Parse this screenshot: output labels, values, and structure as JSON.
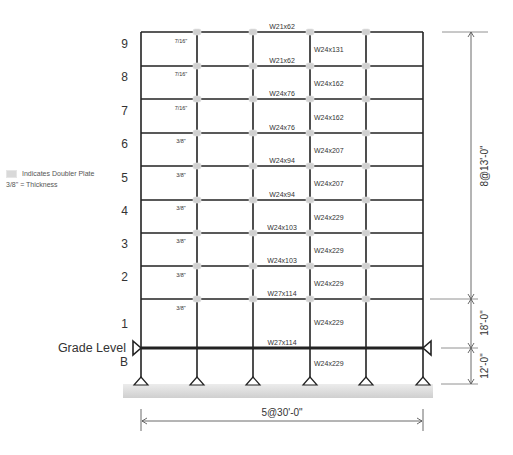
{
  "legend": {
    "doubler_plate_label": "Indicates Doubler Plate",
    "thickness_label": "3/8\" = Thickness"
  },
  "grid": {
    "columns_x": [
      141,
      197,
      253,
      310,
      366,
      423
    ],
    "floor_levels": [
      {
        "label": "9",
        "y": 32
      },
      {
        "label": "8",
        "y": 66
      },
      {
        "label": "7",
        "y": 99
      },
      {
        "label": "6",
        "y": 133
      },
      {
        "label": "5",
        "y": 166
      },
      {
        "label": "4",
        "y": 200
      },
      {
        "label": "3",
        "y": 233
      },
      {
        "label": "2",
        "y": 266
      },
      {
        "label": "1",
        "y": 299
      }
    ],
    "grade_y": 348,
    "base_y": 383
  },
  "story_labels": [
    {
      "label": "9",
      "y": 48
    },
    {
      "label": "8",
      "y": 81
    },
    {
      "label": "7",
      "y": 115
    },
    {
      "label": "6",
      "y": 148
    },
    {
      "label": "5",
      "y": 182
    },
    {
      "label": "4",
      "y": 215
    },
    {
      "label": "3",
      "y": 248
    },
    {
      "label": "2",
      "y": 281
    },
    {
      "label": "1",
      "y": 328
    },
    {
      "label": "B",
      "y": 366
    }
  ],
  "grade_label": "Grade Level",
  "beams": [
    {
      "label": "W21x62",
      "y": 29
    },
    {
      "label": "W21x62",
      "y": 63
    },
    {
      "label": "W24x76",
      "y": 96
    },
    {
      "label": "W24x76",
      "y": 130
    },
    {
      "label": "W24x94",
      "y": 163
    },
    {
      "label": "W24x94",
      "y": 197
    },
    {
      "label": "W24x103",
      "y": 230
    },
    {
      "label": "W24x103",
      "y": 263
    },
    {
      "label": "W27x114",
      "y": 296
    },
    {
      "label": "W27x114",
      "y": 345
    }
  ],
  "columns": [
    {
      "label": "W24x131",
      "y": 52
    },
    {
      "label": "W24x162",
      "y": 86
    },
    {
      "label": "W24x162",
      "y": 120
    },
    {
      "label": "W24x207",
      "y": 153
    },
    {
      "label": "W24x207",
      "y": 186
    },
    {
      "label": "W24x229",
      "y": 220
    },
    {
      "label": "W24x229",
      "y": 253
    },
    {
      "label": "W24x229",
      "y": 286
    },
    {
      "label": "W24x229",
      "y": 325
    },
    {
      "label": "W24x229",
      "y": 366
    }
  ],
  "doubler_thickness": [
    {
      "label": "7/16\"",
      "y": 43
    },
    {
      "label": "7/16\"",
      "y": 76
    },
    {
      "label": "7/16\"",
      "y": 110
    },
    {
      "label": "3/8\"",
      "y": 143
    },
    {
      "label": "3/8\"",
      "y": 177
    },
    {
      "label": "3/8\"",
      "y": 210
    },
    {
      "label": "3/8\"",
      "y": 243
    },
    {
      "label": "3/8\"",
      "y": 277
    },
    {
      "label": "3/8\"",
      "y": 310
    }
  ],
  "dimensions": {
    "upper": "8@13'-0\"",
    "first_story": "18'-0\"",
    "basement": "12'-0\"",
    "bays": "5@30'-0\""
  },
  "colors": {
    "frame": "#222222",
    "doubler": "#d0d0d0",
    "ground": "#dcdcdc",
    "dim_line": "#444444"
  }
}
